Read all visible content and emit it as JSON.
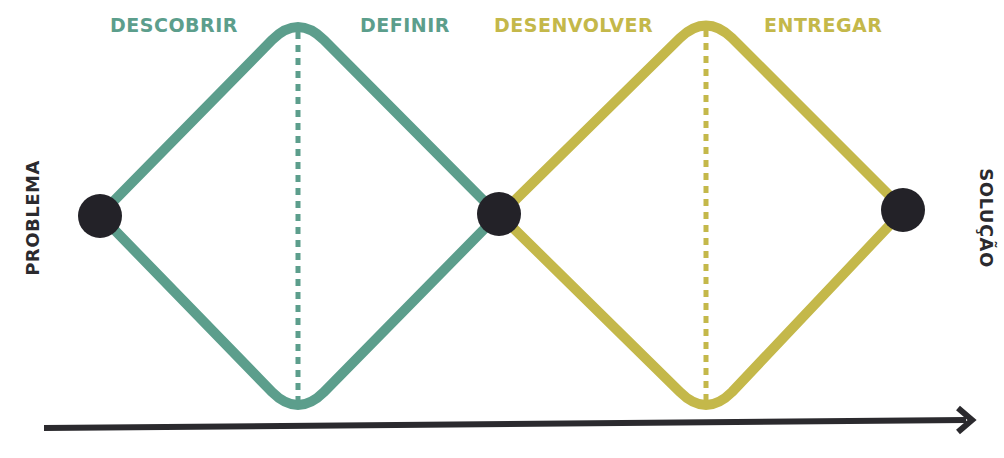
{
  "colors": {
    "teal": "#5c9e8c",
    "olive": "#c4b84a",
    "node": "#232228",
    "arrow": "#2b2a2e",
    "background": "#ffffff"
  },
  "start_label": "PROBLEMA",
  "end_label": "SOLUÇÃO",
  "diamonds": [
    {
      "color": "#5c9e8c",
      "phases": [
        {
          "label": "DESCOBRIR",
          "type": "diverge"
        },
        {
          "label": "DEFINIR",
          "type": "converge"
        }
      ]
    },
    {
      "color": "#c4b84a",
      "phases": [
        {
          "label": "DESENVOLVER",
          "type": "diverge"
        },
        {
          "label": "ENTREGAR",
          "type": "converge"
        }
      ]
    }
  ],
  "nodes": [
    "start",
    "middle",
    "end"
  ],
  "timeline_arrow": {
    "direction": "right"
  }
}
